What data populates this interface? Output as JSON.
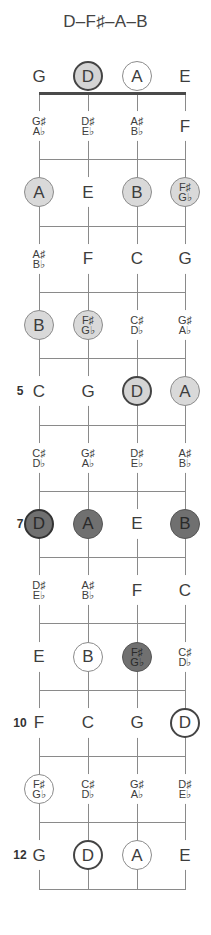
{
  "title": "D–F♯–A–B",
  "strings": [
    "G",
    "D",
    "A",
    "E"
  ],
  "layout": {
    "string_x": [
      39,
      88,
      137,
      185
    ],
    "nut_y": 93,
    "fret_spacing": 66.3,
    "open_y": 76,
    "num_frets": 12
  },
  "colors": {
    "light": "#d9d9d9",
    "dark": "#707070",
    "line": "#8a8a8a",
    "nut": "#4a4a4a"
  },
  "fret_numbers": [
    {
      "fret": 5,
      "label": "5"
    },
    {
      "fret": 7,
      "label": "7"
    },
    {
      "fret": 10,
      "label": "10"
    },
    {
      "fret": 12,
      "label": "12"
    }
  ],
  "frets": [
    {
      "fret": 0,
      "notes": [
        {
          "name": "G",
          "style": "plain"
        },
        {
          "name": "D",
          "style": "light-bold"
        },
        {
          "name": "A",
          "style": "outline"
        },
        {
          "name": "E",
          "style": "plain"
        }
      ]
    },
    {
      "fret": 1,
      "notes": [
        {
          "name": "G♯",
          "alt": "A♭",
          "style": "plain"
        },
        {
          "name": "D♯",
          "alt": "E♭",
          "style": "plain"
        },
        {
          "name": "A♯",
          "alt": "B♭",
          "style": "plain"
        },
        {
          "name": "F",
          "style": "plain"
        }
      ]
    },
    {
      "fret": 2,
      "notes": [
        {
          "name": "A",
          "style": "light"
        },
        {
          "name": "E",
          "style": "plain"
        },
        {
          "name": "B",
          "style": "light"
        },
        {
          "name": "F♯",
          "alt": "G♭",
          "style": "light"
        }
      ]
    },
    {
      "fret": 3,
      "notes": [
        {
          "name": "A♯",
          "alt": "B♭",
          "style": "plain"
        },
        {
          "name": "F",
          "style": "plain"
        },
        {
          "name": "C",
          "style": "plain"
        },
        {
          "name": "G",
          "style": "plain"
        }
      ]
    },
    {
      "fret": 4,
      "notes": [
        {
          "name": "B",
          "style": "light"
        },
        {
          "name": "F♯",
          "alt": "G♭",
          "style": "light"
        },
        {
          "name": "C♯",
          "alt": "D♭",
          "style": "plain"
        },
        {
          "name": "G♯",
          "alt": "A♭",
          "style": "plain"
        }
      ]
    },
    {
      "fret": 5,
      "notes": [
        {
          "name": "C",
          "style": "plain"
        },
        {
          "name": "G",
          "style": "plain"
        },
        {
          "name": "D",
          "style": "light-bold"
        },
        {
          "name": "A",
          "style": "light"
        }
      ]
    },
    {
      "fret": 6,
      "notes": [
        {
          "name": "C♯",
          "alt": "D♭",
          "style": "plain"
        },
        {
          "name": "G♯",
          "alt": "A♭",
          "style": "plain"
        },
        {
          "name": "D♯",
          "alt": "E♭",
          "style": "plain"
        },
        {
          "name": "A♯",
          "alt": "B♭",
          "style": "plain"
        }
      ]
    },
    {
      "fret": 7,
      "notes": [
        {
          "name": "D",
          "style": "dark-bold"
        },
        {
          "name": "A",
          "style": "dark"
        },
        {
          "name": "E",
          "style": "plain"
        },
        {
          "name": "B",
          "style": "dark"
        }
      ]
    },
    {
      "fret": 8,
      "notes": [
        {
          "name": "D♯",
          "alt": "E♭",
          "style": "plain"
        },
        {
          "name": "A♯",
          "alt": "B♭",
          "style": "plain"
        },
        {
          "name": "F",
          "style": "plain"
        },
        {
          "name": "C",
          "style": "plain"
        }
      ]
    },
    {
      "fret": 9,
      "notes": [
        {
          "name": "E",
          "style": "plain"
        },
        {
          "name": "B",
          "style": "outline"
        },
        {
          "name": "F♯",
          "alt": "G♭",
          "style": "dark"
        },
        {
          "name": "C♯",
          "alt": "D♭",
          "style": "plain"
        }
      ]
    },
    {
      "fret": 10,
      "notes": [
        {
          "name": "F",
          "style": "plain"
        },
        {
          "name": "C",
          "style": "plain"
        },
        {
          "name": "G",
          "style": "plain"
        },
        {
          "name": "D",
          "style": "outline-bold"
        }
      ]
    },
    {
      "fret": 11,
      "notes": [
        {
          "name": "F♯",
          "alt": "G♭",
          "style": "outline"
        },
        {
          "name": "C♯",
          "alt": "D♭",
          "style": "plain"
        },
        {
          "name": "G♯",
          "alt": "A♭",
          "style": "plain"
        },
        {
          "name": "D♯",
          "alt": "E♭",
          "style": "plain"
        }
      ]
    },
    {
      "fret": 12,
      "notes": [
        {
          "name": "G",
          "style": "plain"
        },
        {
          "name": "D",
          "style": "outline-bold"
        },
        {
          "name": "A",
          "style": "outline"
        },
        {
          "name": "E",
          "style": "plain"
        }
      ]
    }
  ]
}
